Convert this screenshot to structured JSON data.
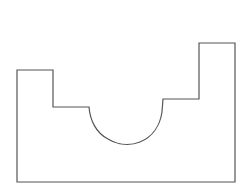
{
  "diagram": {
    "type": "line-drawing",
    "stroke_color": "#555555",
    "background": "#ffffff",
    "profile_points": [
      [
        17,
        70
      ],
      [
        53,
        70
      ],
      [
        53,
        107
      ],
      [
        89,
        107
      ],
      "arc",
      [
        163,
        99
      ],
      [
        199,
        99
      ],
      [
        199,
        43
      ],
      [
        235,
        43
      ],
      [
        235,
        182
      ],
      [
        17,
        182
      ]
    ]
  }
}
